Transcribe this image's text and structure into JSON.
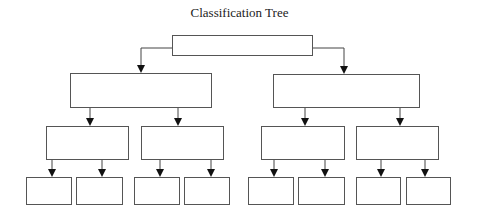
{
  "diagram": {
    "title": "Classification Tree",
    "nodes": [
      {
        "id": "root",
        "label": "",
        "x": 172,
        "y": 35,
        "w": 140,
        "h": 20
      },
      {
        "id": "L1a",
        "label": "",
        "x": 70,
        "y": 73,
        "w": 141,
        "h": 34
      },
      {
        "id": "L1b",
        "label": "",
        "x": 273,
        "y": 74,
        "w": 146,
        "h": 33
      },
      {
        "id": "L2a",
        "label": "",
        "x": 46,
        "y": 126,
        "w": 82,
        "h": 33
      },
      {
        "id": "L2b",
        "label": "",
        "x": 141,
        "y": 126,
        "w": 82,
        "h": 33
      },
      {
        "id": "L2c",
        "label": "",
        "x": 261,
        "y": 126,
        "w": 83,
        "h": 33
      },
      {
        "id": "L2d",
        "label": "",
        "x": 356,
        "y": 126,
        "w": 82,
        "h": 33
      },
      {
        "id": "L3a",
        "label": "",
        "x": 26,
        "y": 177,
        "w": 45,
        "h": 27
      },
      {
        "id": "L3b",
        "label": "",
        "x": 76,
        "y": 177,
        "w": 46,
        "h": 27
      },
      {
        "id": "L3c",
        "label": "",
        "x": 134,
        "y": 177,
        "w": 45,
        "h": 27
      },
      {
        "id": "L3d",
        "label": "",
        "x": 184,
        "y": 177,
        "w": 45,
        "h": 27
      },
      {
        "id": "L3e",
        "label": "",
        "x": 248,
        "y": 177,
        "w": 45,
        "h": 27
      },
      {
        "id": "L3f",
        "label": "",
        "x": 298,
        "y": 177,
        "w": 46,
        "h": 27
      },
      {
        "id": "L3g",
        "label": "",
        "x": 356,
        "y": 177,
        "w": 44,
        "h": 27
      },
      {
        "id": "L3h",
        "label": "",
        "x": 406,
        "y": 177,
        "w": 44,
        "h": 27
      }
    ],
    "edges": [
      {
        "from": "root",
        "to": "L1a",
        "points": [
          [
            172,
            48
          ],
          [
            141,
            48
          ],
          [
            141,
            73
          ]
        ]
      },
      {
        "from": "root",
        "to": "L1b",
        "points": [
          [
            312,
            48
          ],
          [
            344,
            48
          ],
          [
            344,
            74
          ]
        ]
      },
      {
        "from": "L1a",
        "to": "L2a",
        "points": [
          [
            90,
            107
          ],
          [
            90,
            126
          ]
        ]
      },
      {
        "from": "L1a",
        "to": "L2b",
        "points": [
          [
            178,
            107
          ],
          [
            178,
            126
          ]
        ]
      },
      {
        "from": "L1b",
        "to": "L2c",
        "points": [
          [
            305,
            107
          ],
          [
            305,
            126
          ]
        ]
      },
      {
        "from": "L1b",
        "to": "L2d",
        "points": [
          [
            400,
            107
          ],
          [
            400,
            126
          ]
        ]
      },
      {
        "from": "L2a",
        "to": "L3a",
        "points": [
          [
            52,
            159
          ],
          [
            52,
            177
          ]
        ]
      },
      {
        "from": "L2a",
        "to": "L3b",
        "points": [
          [
            102,
            159
          ],
          [
            102,
            177
          ]
        ]
      },
      {
        "from": "L2b",
        "to": "L3c",
        "points": [
          [
            160,
            159
          ],
          [
            160,
            177
          ]
        ]
      },
      {
        "from": "L2b",
        "to": "L3d",
        "points": [
          [
            211,
            159
          ],
          [
            211,
            177
          ]
        ]
      },
      {
        "from": "L2c",
        "to": "L3e",
        "points": [
          [
            274,
            159
          ],
          [
            274,
            177
          ]
        ]
      },
      {
        "from": "L2c",
        "to": "L3f",
        "points": [
          [
            325,
            159
          ],
          [
            325,
            177
          ]
        ]
      },
      {
        "from": "L2d",
        "to": "L3g",
        "points": [
          [
            381,
            159
          ],
          [
            381,
            177
          ]
        ]
      },
      {
        "from": "L2d",
        "to": "L3h",
        "points": [
          [
            425,
            159
          ],
          [
            425,
            177
          ]
        ]
      }
    ]
  }
}
